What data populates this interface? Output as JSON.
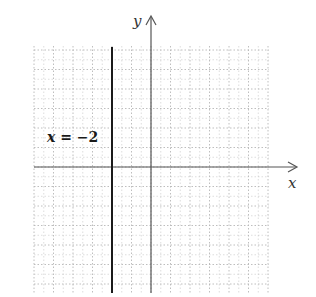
{
  "graph": {
    "x_axis_label": "x",
    "y_axis_label": "y",
    "equation_label": {
      "variable": "x",
      "operator": "=",
      "value": "−2"
    },
    "grid": {
      "x_min": -6,
      "x_max": 6,
      "y_min": -6,
      "y_max": 6,
      "major_step": 1,
      "minor_step": 0.5,
      "style": "dotted"
    },
    "line": {
      "type": "vertical",
      "x": -2
    },
    "colors": {
      "grid": "#b8b8b8",
      "axis": "#555555",
      "line": "#1a1a1a",
      "text": "#333333"
    }
  },
  "chart_data": {
    "type": "line",
    "title": "",
    "xlabel": "x",
    "ylabel": "y",
    "xlim": [
      -6,
      6
    ],
    "ylim": [
      -6,
      6
    ],
    "grid": true,
    "series": [
      {
        "name": "x = −2",
        "x": [
          -2,
          -2
        ],
        "y": [
          -6,
          6
        ]
      }
    ],
    "annotations": [
      "x = −2"
    ]
  }
}
